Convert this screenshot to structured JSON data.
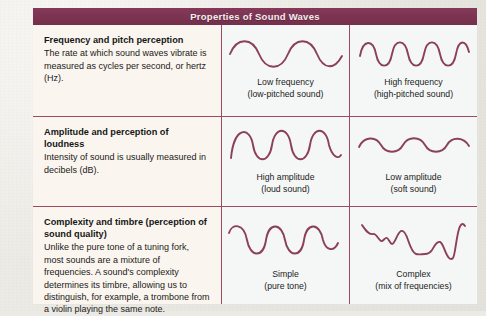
{
  "header": {
    "title": "Properties of Sound Waves",
    "bar_color": "#7e3550",
    "text_color": "#f3eef0"
  },
  "theme": {
    "rule_color": "#9d4a63",
    "wave_color": "#8c4058",
    "desc_bg": "#faf6ef",
    "wave_bg": "#f4f7f6",
    "page_bg": "#eceae4"
  },
  "rows": [
    {
      "id": "frequency-pitch",
      "description": {
        "title": "Frequency and pitch perception",
        "body": "The rate at which sound waves vibrate is measured as cycles per second, or hertz (Hz)."
      },
      "middle": {
        "wave": "low-frequency-wave",
        "cycles": 2,
        "amplitude": "medium",
        "caption_line1": "Low frequency",
        "caption_line2": "(low-pitched sound)"
      },
      "right": {
        "wave": "high-frequency-wave",
        "cycles": 4,
        "amplitude": "medium",
        "caption_line1": "High frequency",
        "caption_line2": "(high-pitched sound)"
      }
    },
    {
      "id": "amplitude-loudness",
      "description": {
        "title": "Amplitude and perception of loudness",
        "body": "Intensity of sound is usually measured in decibels (dB)."
      },
      "middle": {
        "wave": "high-amplitude-wave",
        "cycles": 3,
        "amplitude": "high",
        "caption_line1": "High amplitude",
        "caption_line2": "(loud sound)"
      },
      "right": {
        "wave": "low-amplitude-wave",
        "cycles": 4,
        "amplitude": "low",
        "caption_line1": "Low amplitude",
        "caption_line2": "(soft sound)"
      }
    },
    {
      "id": "complexity-timbre",
      "description": {
        "title": "Complexity and timbre (perception of sound quality)",
        "body": "Unlike the pure tone of a tuning fork, most sounds are a mixture of frequencies. A sound's complexity determines its timbre, allowing us to distinguish, for example, a trombone from a violin playing the same note."
      },
      "middle": {
        "wave": "simple-tone-wave",
        "cycles": 3,
        "amplitude": "medium",
        "caption_line1": "Simple",
        "caption_line2": "(pure tone)"
      },
      "right": {
        "wave": "complex-tone-wave",
        "cycles": 0,
        "amplitude": "irregular",
        "caption_line1": "Complex",
        "caption_line2": "(mix of frequencies)"
      }
    }
  ]
}
